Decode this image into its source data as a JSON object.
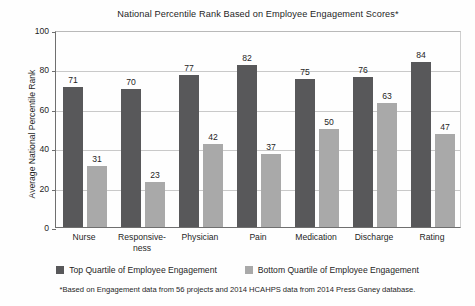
{
  "chart_data": {
    "type": "bar",
    "title": "National Percentile Rank Based on Employee Engagement Scores*",
    "xlabel": "",
    "ylabel": "Average National Percentile Rank",
    "ylim": [
      0,
      100
    ],
    "yticks": [
      0,
      20,
      40,
      60,
      80,
      100
    ],
    "grid": true,
    "legend_position": "bottom",
    "categories": [
      "Nurse",
      "Responsive-\nness",
      "Physician",
      "Pain",
      "Medication",
      "Discharge",
      "Rating"
    ],
    "series": [
      {
        "name": "Top Quartile of Employee Engagement",
        "color": "#58585a",
        "values": [
          71,
          70,
          77,
          82,
          75,
          76,
          84
        ]
      },
      {
        "name": "Bottom Quartile of Employee Engagement",
        "color": "#a9a9a9",
        "values": [
          31,
          23,
          42,
          37,
          50,
          63,
          47
        ]
      }
    ],
    "footnote": "*Based on Engagement data from 56 projects and 2014 HCAHPS data from 2014 Press Ganey database."
  }
}
